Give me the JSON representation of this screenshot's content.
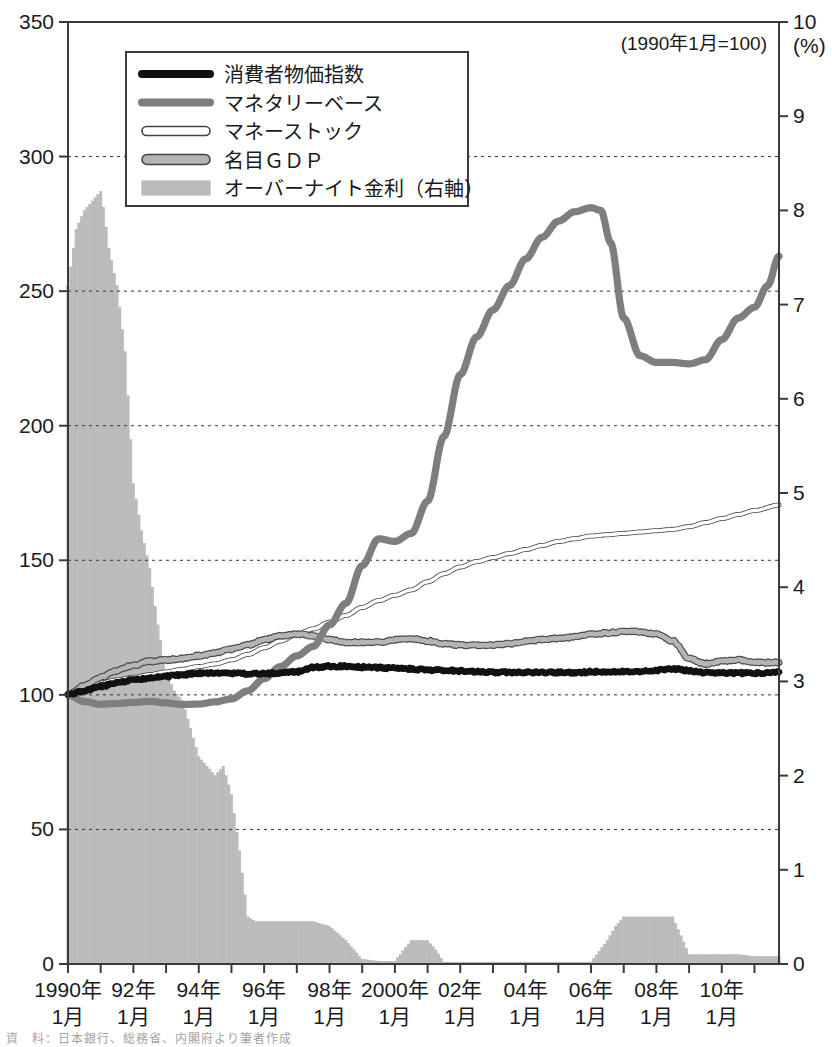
{
  "chart_data": {
    "type": "line",
    "title": "",
    "note": "(1990年1月=100)",
    "xlabel": "",
    "ylabel": "",
    "ylim": [
      0,
      350
    ],
    "y2lim": [
      0,
      10
    ],
    "y2label": "(%)",
    "grid": true,
    "legend_position": "top-left",
    "yticks": [
      0,
      50,
      100,
      150,
      200,
      250,
      300,
      350
    ],
    "y2ticks": [
      0,
      1,
      2,
      3,
      4,
      5,
      6,
      7,
      8,
      9,
      10
    ],
    "xticks": [
      {
        "year": 1990,
        "line1": "1990年",
        "line2": "1月"
      },
      {
        "year": 1992,
        "line1": "92年",
        "line2": "1月"
      },
      {
        "year": 1994,
        "line1": "94年",
        "line2": "1月"
      },
      {
        "year": 1996,
        "line1": "96年",
        "line2": "1月"
      },
      {
        "year": 1998,
        "line1": "98年",
        "line2": "1月"
      },
      {
        "year": 2000,
        "line1": "2000年",
        "line2": "1月"
      },
      {
        "year": 2002,
        "line1": "02年",
        "line2": "1月"
      },
      {
        "year": 2004,
        "line1": "04年",
        "line2": "1月"
      },
      {
        "year": 2006,
        "line1": "06年",
        "line2": "1月"
      },
      {
        "year": 2008,
        "line1": "08年",
        "line2": "1月"
      },
      {
        "year": 2010,
        "line1": "10年",
        "line2": "1月"
      }
    ],
    "xrange": [
      1990.0,
      2011.75
    ],
    "legend": [
      {
        "name": "消費者物価指数",
        "style": "thick-black",
        "color": "#101010"
      },
      {
        "name": "マネタリーベース",
        "style": "thick-gray",
        "color": "#7d7d7d"
      },
      {
        "name": "マネーストック",
        "style": "outline-white",
        "color": "#ffffff"
      },
      {
        "name": "名目ＧＤＰ",
        "style": "outline-lightgray",
        "color": "#c9c9c9"
      },
      {
        "name": "オーバーナイト金利（右軸）",
        "style": "bar-fill",
        "color": "#b9b9b9"
      }
    ],
    "series": [
      {
        "name": "消費者物価指数",
        "axis": "left",
        "x": [
          1990.0,
          1990.5,
          1991.0,
          1991.5,
          1992.0,
          1992.5,
          1993.0,
          1993.5,
          1994.0,
          1994.5,
          1995.0,
          1995.5,
          1996.0,
          1996.5,
          1997.0,
          1997.5,
          1998.0,
          1998.5,
          1999.0,
          1999.5,
          2000.0,
          2000.5,
          2001.0,
          2001.5,
          2002.0,
          2002.5,
          2003.0,
          2003.5,
          2004.0,
          2004.5,
          2005.0,
          2005.5,
          2006.0,
          2006.5,
          2007.0,
          2007.5,
          2008.0,
          2008.5,
          2009.0,
          2009.5,
          2010.0,
          2010.5,
          2011.0,
          2011.75
        ],
        "values": [
          100.0,
          101.5,
          103.2,
          104.4,
          105.6,
          106.2,
          106.9,
          107.5,
          108.0,
          108.2,
          108.0,
          107.8,
          107.9,
          108.2,
          108.6,
          110.2,
          110.6,
          110.6,
          110.3,
          110.1,
          109.9,
          109.6,
          109.3,
          109.2,
          108.9,
          108.6,
          108.4,
          108.4,
          108.3,
          108.3,
          108.3,
          108.3,
          108.5,
          108.6,
          108.6,
          108.7,
          109.2,
          109.7,
          108.9,
          108.3,
          108.1,
          108.1,
          108.1,
          108.4
        ]
      },
      {
        "name": "マネタリーベース",
        "axis": "left",
        "x": [
          1990.0,
          1990.5,
          1991.0,
          1991.5,
          1992.0,
          1992.5,
          1993.0,
          1993.5,
          1994.0,
          1994.5,
          1995.0,
          1995.5,
          1996.0,
          1996.5,
          1997.0,
          1997.5,
          1998.0,
          1998.5,
          1999.0,
          1999.5,
          2000.0,
          2000.5,
          2001.0,
          2001.5,
          2002.0,
          2002.5,
          2003.0,
          2003.5,
          2004.0,
          2004.5,
          2005.0,
          2005.5,
          2006.0,
          2006.3,
          2006.6,
          2007.0,
          2007.5,
          2008.0,
          2008.5,
          2009.0,
          2009.5,
          2010.0,
          2010.5,
          2011.0,
          2011.4,
          2011.75
        ],
        "values": [
          100.0,
          97.5,
          96.5,
          96.8,
          97.2,
          97.6,
          97.0,
          96.4,
          96.6,
          97.4,
          98.5,
          101.5,
          106.0,
          110.5,
          114.5,
          118.0,
          126.0,
          134.0,
          148.0,
          158.0,
          157.0,
          160.0,
          172.0,
          196.0,
          219.0,
          233.0,
          243.0,
          252.0,
          262.0,
          270.0,
          276.0,
          279.5,
          281.0,
          280.0,
          268.0,
          240.0,
          226.0,
          223.5,
          223.5,
          223.0,
          224.5,
          232.0,
          240.0,
          244.0,
          252.0,
          263.0
        ]
      },
      {
        "name": "マネーストック",
        "axis": "left",
        "x": [
          1990.0,
          1990.5,
          1991.0,
          1991.5,
          1992.0,
          1992.5,
          1993.0,
          1993.5,
          1994.0,
          1994.5,
          1995.0,
          1995.5,
          1996.0,
          1996.5,
          1997.0,
          1997.5,
          1998.0,
          1998.5,
          1999.0,
          1999.5,
          2000.0,
          2000.5,
          2001.0,
          2001.5,
          2002.0,
          2002.5,
          2003.0,
          2003.5,
          2004.0,
          2004.5,
          2005.0,
          2005.5,
          2006.0,
          2006.5,
          2007.0,
          2007.5,
          2008.0,
          2008.5,
          2009.0,
          2009.5,
          2010.0,
          2010.5,
          2011.0,
          2011.75
        ],
        "values": [
          100.0,
          102.5,
          104.5,
          105.5,
          106.5,
          107.5,
          108.5,
          109.5,
          110.5,
          111.5,
          113.0,
          115.0,
          117.5,
          120.0,
          122.5,
          124.5,
          127.0,
          129.5,
          132.5,
          135.0,
          137.0,
          139.0,
          142.0,
          145.0,
          147.5,
          149.5,
          151.0,
          152.5,
          154.0,
          155.5,
          157.0,
          158.0,
          159.0,
          159.5,
          160.0,
          160.5,
          161.0,
          161.5,
          162.5,
          164.0,
          165.5,
          167.0,
          168.5,
          170.5
        ]
      },
      {
        "name": "名目ＧＤＰ",
        "axis": "left",
        "x": [
          1990.0,
          1990.5,
          1991.0,
          1991.5,
          1992.0,
          1992.5,
          1993.0,
          1993.5,
          1994.0,
          1994.5,
          1995.0,
          1995.5,
          1996.0,
          1996.5,
          1997.0,
          1997.5,
          1998.0,
          1998.5,
          1999.0,
          1999.5,
          2000.0,
          2000.5,
          2001.0,
          2001.5,
          2002.0,
          2002.5,
          2003.0,
          2003.5,
          2004.0,
          2004.5,
          2005.0,
          2005.5,
          2006.0,
          2006.5,
          2007.0,
          2007.5,
          2008.0,
          2008.5,
          2009.0,
          2009.5,
          2010.0,
          2010.5,
          2011.0,
          2011.75
        ],
        "values": [
          100.0,
          103.5,
          106.5,
          109.0,
          111.0,
          112.5,
          113.0,
          113.5,
          114.5,
          115.5,
          117.0,
          118.5,
          120.5,
          122.0,
          122.5,
          122.0,
          120.5,
          119.5,
          119.5,
          119.5,
          120.5,
          121.0,
          120.0,
          119.0,
          118.5,
          118.5,
          118.5,
          119.0,
          120.0,
          120.5,
          121.0,
          121.5,
          122.5,
          123.0,
          123.5,
          123.5,
          122.5,
          120.0,
          113.5,
          111.5,
          112.5,
          113.0,
          112.0,
          112.0
        ]
      },
      {
        "name": "オーバーナイト金利（右軸）",
        "axis": "right",
        "x": [
          1990.0,
          1990.25,
          1990.5,
          1990.75,
          1991.0,
          1991.1,
          1991.25,
          1991.5,
          1991.75,
          1992.0,
          1992.25,
          1992.5,
          1992.75,
          1993.0,
          1993.25,
          1993.5,
          1993.75,
          1994.0,
          1994.25,
          1994.5,
          1994.75,
          1995.0,
          1995.25,
          1995.5,
          1995.75,
          1996.0,
          1996.5,
          1997.0,
          1997.5,
          1998.0,
          1998.5,
          1999.0,
          1999.5,
          2000.0,
          2000.5,
          2000.75,
          2001.0,
          2001.25,
          2001.5,
          2002.0,
          2003.0,
          2004.0,
          2005.0,
          2006.0,
          2006.5,
          2006.75,
          2007.0,
          2007.5,
          2008.0,
          2008.5,
          2008.75,
          2009.0,
          2009.5,
          2010.0,
          2010.5,
          2011.0,
          2011.75
        ],
        "values": [
          7.2,
          7.8,
          8.0,
          8.1,
          8.2,
          8.0,
          7.6,
          7.2,
          6.5,
          5.1,
          4.6,
          4.2,
          3.6,
          3.1,
          2.9,
          2.8,
          2.5,
          2.2,
          2.1,
          2.0,
          2.1,
          1.8,
          1.2,
          0.5,
          0.45,
          0.45,
          0.45,
          0.45,
          0.45,
          0.4,
          0.25,
          0.05,
          0.03,
          0.03,
          0.25,
          0.25,
          0.25,
          0.15,
          0.02,
          0.02,
          0.02,
          0.02,
          0.02,
          0.02,
          0.25,
          0.4,
          0.5,
          0.5,
          0.5,
          0.5,
          0.3,
          0.1,
          0.1,
          0.1,
          0.1,
          0.08,
          0.08
        ]
      }
    ]
  }
}
